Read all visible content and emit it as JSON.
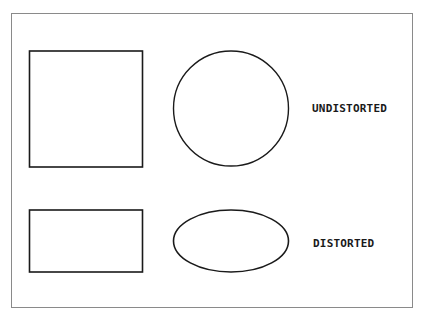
{
  "diagram": {
    "rows": [
      {
        "label": "UNDISTORTED",
        "shapes": [
          "square",
          "circle"
        ]
      },
      {
        "label": "DISTORTED",
        "shapes": [
          "rectangle",
          "ellipse"
        ]
      }
    ],
    "colors": {
      "stroke": "#1a1a1a",
      "frame": "#8a8a8a",
      "background": "#ffffff"
    }
  }
}
